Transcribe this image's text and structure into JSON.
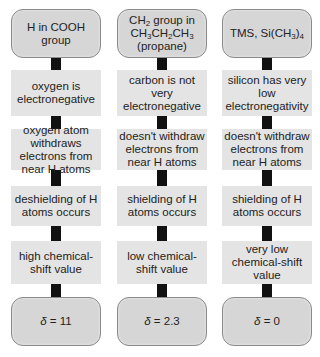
{
  "diagram": {
    "columns": [
      {
        "header": {
          "html": "H in COOH group"
        },
        "steps": [
          "oxygen is electronegative",
          "oxygen atom withdraws electrons from near H atoms",
          "deshielding of H atoms occurs",
          "high chemical-shift value"
        ],
        "result": {
          "symbol": "δ",
          "value": "11",
          "text": "δ = 11"
        }
      },
      {
        "header": {
          "html": "CH<sub>2</sub> group in CH<sub>3</sub>CH<sub>2</sub>CH<sub>3</sub> (propane)"
        },
        "steps": [
          "carbon is not very electronegative",
          "doesn't withdraw electrons from near H atoms",
          "shielding of H atoms occurs",
          "low chemical-shift value"
        ],
        "result": {
          "symbol": "δ",
          "value": "2.3",
          "text": "δ = 2.3"
        }
      },
      {
        "header": {
          "html": "TMS, Si(CH<sub>3</sub>)<sub>4</sub>"
        },
        "steps": [
          "silicon has very low electronegativity",
          "doesn't withdraw electrons from near H atoms",
          "shielding of H atoms occurs",
          "very low chemical-shift value"
        ],
        "result": {
          "symbol": "δ",
          "value": "0",
          "text": "δ = 0"
        }
      }
    ],
    "colors": {
      "rounded_fill": "#d6d6d6",
      "rounded_border": "#8a8a8a",
      "rect_fill": "#e4e4e4",
      "connector": "#111111"
    }
  }
}
